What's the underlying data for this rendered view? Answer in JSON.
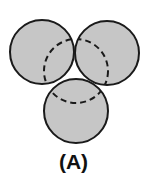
{
  "figure": {
    "label": "(A)",
    "fill_color": "#c6c6c6",
    "stroke_color": "#1a1a1a",
    "circles": [
      {
        "name": "top-left",
        "cx": 42,
        "cy": 52,
        "r": 32
      },
      {
        "name": "top-right",
        "cx": 107,
        "cy": 53,
        "r": 32
      },
      {
        "name": "bottom",
        "cx": 76,
        "cy": 111,
        "r": 32
      }
    ],
    "dashed_circle": {
      "cx": 76,
      "cy": 71,
      "r": 32
    }
  }
}
